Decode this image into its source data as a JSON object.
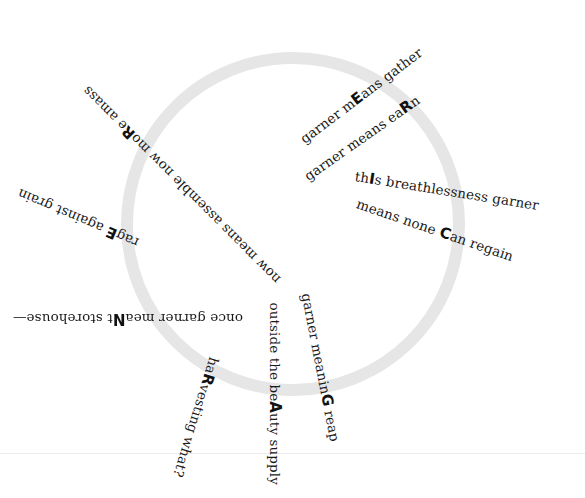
{
  "poem": {
    "acrostic": "MERICANGARNER",
    "lines": [
      {
        "id": "line-1",
        "before": "garner m",
        "cap": "E",
        "after": "ans gather",
        "x": 302,
        "y": 140,
        "angle": -37
      },
      {
        "id": "line-2",
        "before": "garner means ea",
        "cap": "R",
        "after": "n",
        "x": 306,
        "y": 177,
        "angle": -35
      },
      {
        "id": "line-3",
        "before": "th",
        "cap": "I",
        "after": "s breathlessness garner",
        "x": 355,
        "y": 176,
        "angle": 9
      },
      {
        "id": "line-4",
        "before": "means none ",
        "cap": "C",
        "after": "an regain",
        "x": 357,
        "y": 203,
        "angle": 19
      },
      {
        "id": "line-5",
        "before": "now means assemble  now mo",
        "cap": "R",
        "after": "e amass",
        "x": 278,
        "y": 281,
        "angle": 225
      },
      {
        "id": "line-6",
        "before": "rag",
        "cap": "E",
        "after": " against grain",
        "x": 138,
        "y": 243,
        "angle": 203
      },
      {
        "id": "line-7",
        "before": "once garner mea",
        "cap": "N",
        "after": "t storehouse—",
        "x": 243,
        "y": 318,
        "angle": 180
      },
      {
        "id": "line-8",
        "before": "ha",
        "cap": "R",
        "after": "vesting what?",
        "x": 214,
        "y": 357,
        "angle": 107
      },
      {
        "id": "line-9",
        "before": "outside the be",
        "cap": "A",
        "after": "uty supply",
        "x": 274,
        "y": 302,
        "angle": 90
      },
      {
        "id": "line-10",
        "before": "garner meanin",
        "cap": "G",
        "after": " reap",
        "x": 306,
        "y": 293,
        "angle": 79
      }
    ]
  },
  "colors": {
    "ring": "#e6e6e6",
    "text": "#1a1a1a",
    "background": "#ffffff"
  }
}
